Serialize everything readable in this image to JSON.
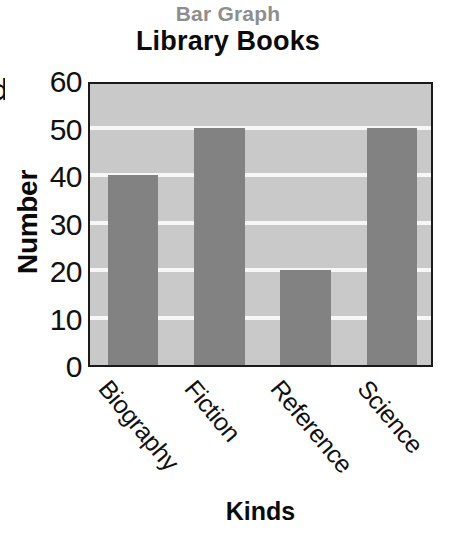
{
  "chart_data": {
    "type": "bar",
    "title": "Library Books",
    "subtitle": "Bar Graph",
    "xlabel": "Kinds",
    "ylabel": "Number",
    "categories": [
      "Biography",
      "Fiction",
      "Reference",
      "Science"
    ],
    "values": [
      40,
      50,
      20,
      50
    ],
    "ylim": [
      0,
      60
    ],
    "yticks": [
      60,
      50,
      40,
      30,
      20,
      10,
      0
    ],
    "grid": true,
    "legend": "none",
    "colors": {
      "bar": "#828282",
      "plot_background": "#c9c9c9",
      "gridline": "#f7f7f7",
      "axis_border": "#1a1a1a",
      "title": "#0a0a0a",
      "subtitle": "#8e8e8e",
      "tick_text": "#111111"
    }
  },
  "margin_artifact": {
    "clipped_glyph": "d"
  }
}
